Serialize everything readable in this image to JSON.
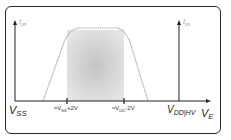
{
  "diagram": {
    "title": "",
    "left_axis_label": {
      "main": "I",
      "sub": "on"
    },
    "right_axis_label": {
      "main": "I",
      "sub": "os"
    },
    "x_axis_label": {
      "main": "V",
      "sub": "E"
    },
    "x_ticks": [
      {
        "main": "V",
        "sub": "SS",
        "suffix": ""
      },
      {
        "prefix": "≈V",
        "sub": "SS",
        "suffix": "+2V"
      },
      {
        "prefix": "≈V",
        "sub": "DD",
        "suffix": "-2V"
      },
      {
        "main": "V",
        "sub": "DD|HV",
        "suffix": ""
      }
    ],
    "colors": {
      "axis": "#222222",
      "curve": "#b0b0b0",
      "shade_center": "#c8c8c8",
      "shade_edge": "#e6e6e6",
      "frame": "#2a2a2a"
    }
  }
}
